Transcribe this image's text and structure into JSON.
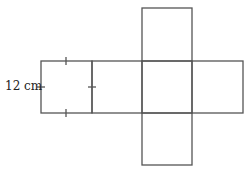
{
  "diagram": {
    "type": "cube-net",
    "side_label": "12 cm",
    "line_color": "#555555",
    "squares": [
      {
        "name": "left",
        "x": 41,
        "y": 61,
        "size": 51
      },
      {
        "name": "center-left",
        "x": 92,
        "y": 61,
        "size": 50
      },
      {
        "name": "center",
        "x": 142,
        "y": 61,
        "size": 50
      },
      {
        "name": "right",
        "x": 192,
        "y": 61,
        "size": 51
      },
      {
        "name": "top",
        "x": 142,
        "y": 8,
        "size": 53
      },
      {
        "name": "bottom",
        "x": 142,
        "y": 113,
        "size": 52
      }
    ],
    "tick_marks": 4
  }
}
